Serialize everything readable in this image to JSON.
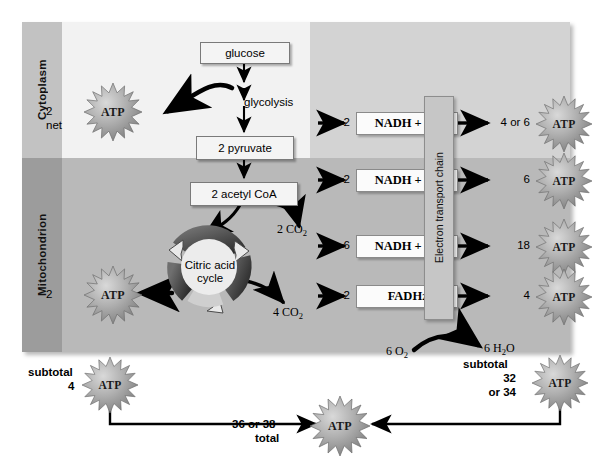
{
  "diagram": {
    "compartments": [
      {
        "name": "cytoplasm",
        "label": "Cytoplasm"
      },
      {
        "name": "mitochondrion",
        "label": "Mitochondrion"
      }
    ],
    "pathway_boxes": [
      {
        "name": "glucose",
        "label": "glucose"
      },
      {
        "name": "pyruvate",
        "label": "2 pyruvate"
      },
      {
        "name": "acetyl-coa",
        "label": "2 acetyl CoA"
      }
    ],
    "process_labels": {
      "glycolysis": "glycolysis",
      "citric_acid_cycle_line1": "Citric acid",
      "citric_acid_cycle_line2": "cycle",
      "electron_transport_chain": "Electron transport chain"
    },
    "carriers": [
      {
        "name": "nadh-glycolysis",
        "count": "2",
        "formula_main": "NADH + H",
        "formula_sup": "+"
      },
      {
        "name": "nadh-pyruvate-oxidation",
        "count": "2",
        "formula_main": "NADH + H",
        "formula_sup": "+"
      },
      {
        "name": "nadh-citric-acid-cycle",
        "count": "6",
        "formula_main": "NADH + H",
        "formula_sup": "+"
      },
      {
        "name": "fadh2-citric-acid-cycle",
        "count": "2",
        "formula_main": "FADH",
        "formula_sub": "2"
      }
    ],
    "co2_outputs": [
      {
        "name": "co2-pyruvate-oxidation",
        "count": "2",
        "formula": "CO",
        "sub": "2"
      },
      {
        "name": "co2-citric-acid-cycle",
        "count": "4",
        "formula": "CO",
        "sub": "2"
      }
    ],
    "oxygen_water": {
      "oxygen_count": "6",
      "oxygen_formula": "O",
      "oxygen_sub": "2",
      "water_count": "6",
      "water_formula_a": "H",
      "water_sub": "2",
      "water_formula_b": "O"
    },
    "atp_outputs": [
      {
        "name": "atp-glycolysis",
        "qty_line1": "2",
        "qty_line2": "net",
        "label": "ATP"
      },
      {
        "name": "atp-citric-acid-cycle",
        "qty_line1": "2",
        "qty_line2": "",
        "label": "ATP"
      },
      {
        "name": "atp-etc-1",
        "qty_line1": "4 or 6",
        "qty_line2": "",
        "label": "ATP"
      },
      {
        "name": "atp-etc-2",
        "qty_line1": "6",
        "qty_line2": "",
        "label": "ATP"
      },
      {
        "name": "atp-etc-3",
        "qty_line1": "18",
        "qty_line2": "",
        "label": "ATP"
      },
      {
        "name": "atp-etc-4",
        "qty_line1": "4",
        "qty_line2": "",
        "label": "ATP"
      }
    ],
    "totals": {
      "subtotal_left_word": "subtotal",
      "subtotal_left_value": "4",
      "subtotal_left_atp": "ATP",
      "subtotal_right_word": "subtotal",
      "subtotal_right_value": "32",
      "subtotal_right_value_alt": "or 34",
      "subtotal_right_atp": "ATP",
      "grand_total_value": "36 or 38",
      "grand_total_word": "total",
      "grand_total_atp": "ATP"
    },
    "colors": {
      "cytoplasm_band": "#d3d3d3",
      "mitochondrion_band": "#b9b9b9",
      "glycolysis_panel": "#f2f2f2",
      "side_tab_cytoplasm": "#c2c2c2",
      "side_tab_mitochondrion": "#9c9c9c",
      "atp_star": "#9a9a9a",
      "arrow": "#000000"
    }
  }
}
